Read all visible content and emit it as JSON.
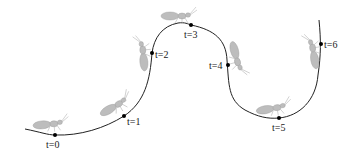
{
  "diagram": {
    "type": "trajectory",
    "path_color": "#222222",
    "ant_color": "#bdbdbd",
    "points": [
      {
        "label": "t=0",
        "x": 55,
        "y": 135
      },
      {
        "label": "t=1",
        "x": 124,
        "y": 116
      },
      {
        "label": "t=2",
        "x": 152,
        "y": 53
      },
      {
        "label": "t=3",
        "x": 191,
        "y": 25
      },
      {
        "label": "t=4",
        "x": 228,
        "y": 65
      },
      {
        "label": "t=5",
        "x": 279,
        "y": 118
      },
      {
        "label": "t=6",
        "x": 321,
        "y": 44
      }
    ]
  }
}
